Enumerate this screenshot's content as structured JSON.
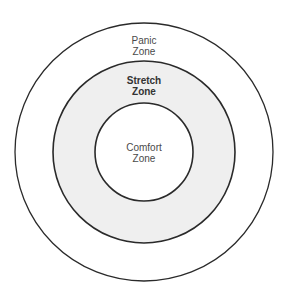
{
  "diagram": {
    "type": "concentric-circles",
    "colors": {
      "background": "#ffffff",
      "stroke": "#2a2a2a",
      "outer_fill": "#ffffff",
      "middle_fill": "#efefef",
      "inner_fill": "#ffffff",
      "text": "#4a4a4a"
    },
    "zones": [
      {
        "id": "panic",
        "line1": "Panic",
        "line2": "Zone",
        "bold": false,
        "ring": "outer"
      },
      {
        "id": "stretch",
        "line1": "Stretch",
        "line2": "Zone",
        "bold": true,
        "ring": "middle"
      },
      {
        "id": "comfort",
        "line1": "Comfort",
        "line2": "Zone",
        "bold": false,
        "ring": "inner"
      }
    ]
  }
}
